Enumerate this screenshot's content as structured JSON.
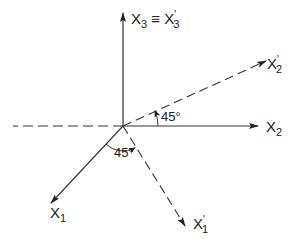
{
  "diagram": {
    "type": "coordinate-axes-rotation",
    "origin": {
      "x": 123,
      "y": 126
    },
    "stroke_color": "#333333",
    "axes": {
      "x3": {
        "label_main": "X",
        "label_sub": "3",
        "equiv": "≡",
        "label_prime_main": "X",
        "label_prime_sup": "'",
        "label_prime_sub": "3",
        "style": "solid",
        "direction": "up"
      },
      "x2": {
        "label_main": "X",
        "label_sub": "2",
        "style": "solid",
        "direction": "right"
      },
      "x2_prime": {
        "label_main": "X",
        "label_sup": "'",
        "label_sub": "2",
        "style": "dashed",
        "direction": "up-right"
      },
      "x1": {
        "label_main": "X",
        "label_sub": "1",
        "style": "solid",
        "direction": "down-left"
      },
      "x1_prime": {
        "label_main": "X",
        "label_sup": "'",
        "label_sub": "1",
        "style": "dashed",
        "direction": "down-right"
      },
      "x2_negative": {
        "style": "dashed",
        "direction": "left"
      }
    },
    "angles": {
      "upper": {
        "label": "45°",
        "between": [
          "X2",
          "X'2"
        ]
      },
      "lower": {
        "label": "45°",
        "between": [
          "X1",
          "X'1"
        ]
      }
    }
  }
}
